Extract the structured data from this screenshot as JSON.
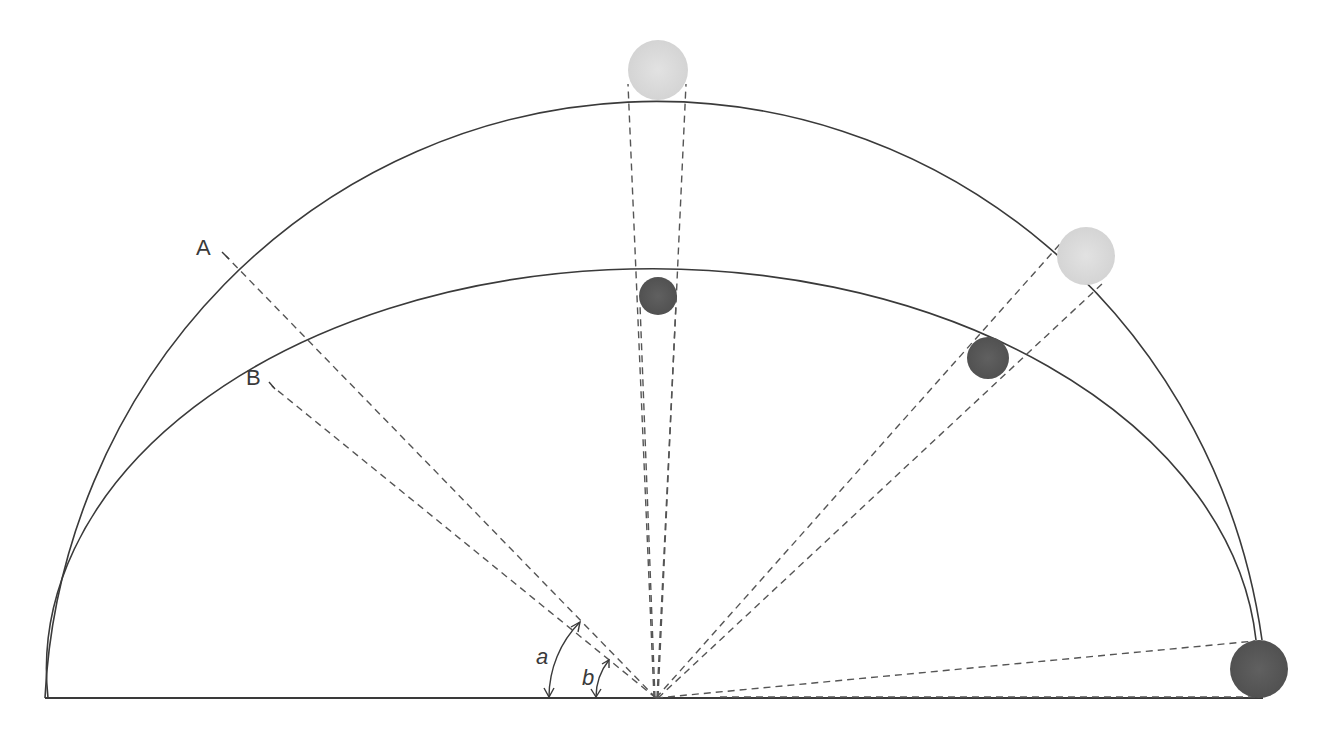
{
  "diagram": {
    "type": "celestial-sphere-flattening",
    "labels": {
      "outer_arc": "A",
      "inner_arc": "B",
      "angle_a": "a",
      "angle_b": "b"
    },
    "colors": {
      "stroke": "#3a3a3a",
      "dashed": "#555555",
      "light_body": "#d9d9d9",
      "dark_body": "#5a5a5a"
    },
    "observer": {
      "x": 656,
      "y": 698
    },
    "baseline": {
      "x1": 45,
      "x2": 1263,
      "y": 698
    },
    "outer_arc": {
      "cx": 656,
      "cy": 698,
      "rx": 612,
      "ry": 628
    },
    "inner_arc": {
      "cx": 656,
      "cy": 698,
      "rx": 605,
      "ry": 400
    },
    "bodies": [
      {
        "name": "light-body-zenith",
        "cx": 658,
        "cy": 70,
        "r": 30,
        "shade": "light"
      },
      {
        "name": "dark-body-zenith",
        "cx": 658,
        "cy": 296,
        "r": 19,
        "shade": "dark"
      },
      {
        "name": "light-body-mid",
        "cx": 1086,
        "cy": 256,
        "r": 29,
        "shade": "light"
      },
      {
        "name": "dark-body-mid",
        "cx": 988,
        "cy": 358,
        "r": 21,
        "shade": "dark"
      },
      {
        "name": "dark-body-horizon",
        "cx": 1259,
        "cy": 669,
        "r": 29,
        "shade": "dark"
      }
    ]
  }
}
